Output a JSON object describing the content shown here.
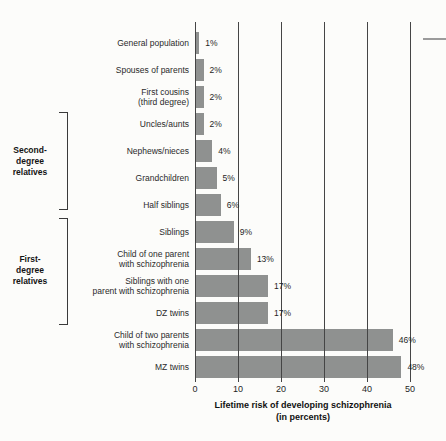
{
  "chart_data": {
    "type": "bar",
    "orientation": "horizontal",
    "title": "",
    "xlabel": "Lifetime risk of developing schizophrenia\n(in percents)",
    "x_ticks": [
      0,
      10,
      20,
      30,
      40,
      50
    ],
    "xlim": [
      0,
      50
    ],
    "grid": "vertical-lines-on",
    "bar_color": "#8f9190",
    "gridline_color": "#454545",
    "rows": [
      {
        "label": "General population",
        "value": 1,
        "value_label": "1%"
      },
      {
        "label": "Spouses of parents",
        "value": 2,
        "value_label": "2%"
      },
      {
        "label": "First cousins\n(third degree)",
        "value": 2,
        "value_label": "2%"
      },
      {
        "label": "Uncles/aunts",
        "value": 2,
        "value_label": "2%"
      },
      {
        "label": "Nephews/nieces",
        "value": 4,
        "value_label": "4%"
      },
      {
        "label": "Grandchildren",
        "value": 5,
        "value_label": "5%"
      },
      {
        "label": "Half siblings",
        "value": 6,
        "value_label": "6%"
      },
      {
        "label": "Siblings",
        "value": 9,
        "value_label": "9%"
      },
      {
        "label": "Child of one parent\nwith schizophrenia",
        "value": 13,
        "value_label": "13%"
      },
      {
        "label": "Siblings with one\nparent with schizophrenia",
        "value": 17,
        "value_label": "17%"
      },
      {
        "label": "DZ twins",
        "value": 17,
        "value_label": "17%"
      },
      {
        "label": "Child of two parents\nwith schizophrenia",
        "value": 46,
        "value_label": "46%"
      },
      {
        "label": "MZ twins",
        "value": 48,
        "value_label": "48%"
      }
    ],
    "groups": [
      {
        "label": "Second-\ndegree\nrelatives",
        "start_row": 3,
        "end_row": 6
      },
      {
        "label": "First-\ndegree\nrelatives",
        "start_row": 7,
        "end_row": 10
      }
    ]
  }
}
